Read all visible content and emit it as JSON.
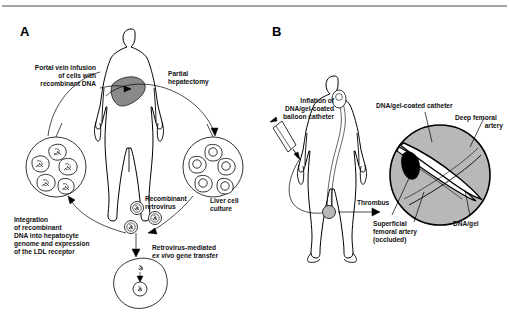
{
  "figure": {
    "top_rule": true,
    "panels": [
      {
        "letter": "A",
        "name": "ex-vivo-gene-therapy"
      },
      {
        "letter": "B",
        "name": "in-vivo-catheter-gene-delivery"
      }
    ]
  },
  "panel_a": {
    "letter": "A",
    "labels": {
      "portal_vein": [
        "Portal vein infusion",
        "of cells with",
        "recombinant DNA"
      ],
      "partial_hepatectomy": [
        "Partial",
        "hepatectomy"
      ],
      "liver_cell_culture": [
        "Liver cell",
        "culture"
      ],
      "recombinant_retrovirus": [
        "Recombinant",
        "retrovirus"
      ],
      "retrovirus_mediated": [
        "Retrovirus-mediated",
        "ex vivo gene transfer"
      ],
      "retrovirus_mediated_italic_part": "ex vivo",
      "retrovirus_mediated_line1": "Retrovirus-mediated",
      "retrovirus_mediated_line2_rest": " gene transfer",
      "integration": [
        "Integration",
        "of recombinant",
        "DNA into hepatocyte",
        "genome and expression",
        "of the LDL receptor"
      ]
    },
    "graphics": {
      "human_figure": "anterior human body outline with shaded liver",
      "liver_color": "#8a8a8a",
      "left_cluster_cells": 5,
      "right_cluster_cells": 5,
      "retrovirus_particles": 3,
      "target_hepatocyte": 1
    }
  },
  "panel_b": {
    "letter": "B",
    "labels": {
      "inflation": [
        "Inflation of",
        "DNA/gel-coated",
        "balloon catheter"
      ],
      "catheter": "DNA/gel-coated catheter",
      "deep_femoral": [
        "Deep femoral",
        "artery"
      ],
      "thrombus": "Thrombus",
      "superficial": [
        "Superficial",
        "femoral artery",
        "(occluded)"
      ],
      "dna_gel": "DNA/gel"
    },
    "graphics": {
      "human_figure": "anterior human body outline with catheter path to femoral artery",
      "inset_type": "circular magnified cross-section",
      "inset_fill": "#b8b8b8",
      "thrombus_color": "#000000"
    }
  },
  "colors": {
    "line": "#000000",
    "text": "#111111",
    "organ_gray": "#8a8a8a",
    "vessel_gray": "#b8b8b8",
    "background": "#ffffff",
    "rule": "#4a4a4a"
  }
}
